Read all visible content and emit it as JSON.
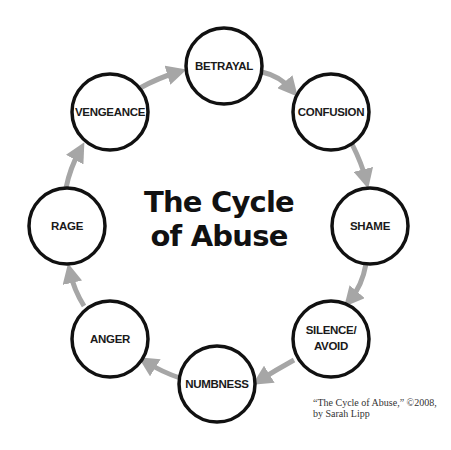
{
  "title": {
    "line1": "The Cycle",
    "line2": "of Abuse"
  },
  "nodes": [
    {
      "id": "betrayal",
      "label": "BETRAYAL"
    },
    {
      "id": "confusion",
      "label": "CONFUSION"
    },
    {
      "id": "shame",
      "label": "SHAME"
    },
    {
      "id": "silence-avoid",
      "label_line1": "SILENCE/",
      "label_line2": "AVOID"
    },
    {
      "id": "numbness",
      "label": "NUMBNESS"
    },
    {
      "id": "anger",
      "label": "ANGER"
    },
    {
      "id": "rage",
      "label": "RAGE"
    },
    {
      "id": "vengeance",
      "label": "VENGEANCE"
    }
  ],
  "credit": {
    "line1": "“The Cycle of Abuse,” ©2008,",
    "line2": "by Sarah Lipp"
  },
  "colors": {
    "circle_stroke": "#111111",
    "arrow": "#a6a6a6",
    "text": "#1a1a1a"
  }
}
